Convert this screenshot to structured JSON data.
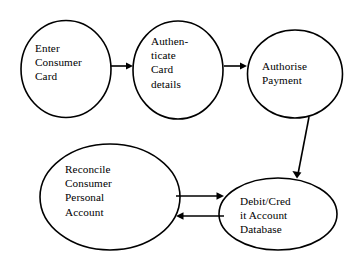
{
  "diagram": {
    "background_color": "#ffffff",
    "stroke_color": "#000000",
    "nodes": [
      {
        "id": "enter-consumer-card",
        "label": "Enter\nConsumer\nCard",
        "shape": "ellipse",
        "cx": 66,
        "cy": 69,
        "rx": 45,
        "ry": 48.5,
        "text_x": 35,
        "text_y": 41
      },
      {
        "id": "authenticate-card-details",
        "label": "Authen-\nticate\nCard\ndetails",
        "shape": "ellipse",
        "cx": 178,
        "cy": 70,
        "rx": 45,
        "ry": 49,
        "text_x": 151,
        "text_y": 34
      },
      {
        "id": "authorise-payment",
        "label": "Authorise\nPayment",
        "shape": "ellipse",
        "cx": 295,
        "cy": 74,
        "rx": 47.5,
        "ry": 44,
        "text_x": 262,
        "text_y": 59
      },
      {
        "id": "reconcile-consumer-personal-account",
        "label": "Reconcile\nConsumer\nPersonal\nAccount",
        "shape": "ellipse",
        "cx": 110,
        "cy": 197,
        "rx": 70,
        "ry": 53,
        "text_x": 65,
        "text_y": 162
      },
      {
        "id": "debit-credit-account-database",
        "label": "Debit/Cred\nit Account\nDatabase",
        "shape": "ellipse",
        "cx": 278,
        "cy": 214,
        "rx": 59,
        "ry": 36,
        "text_x": 240,
        "text_y": 194
      }
    ],
    "edges": [
      {
        "id": "edge-enter-to-authenticate",
        "from": "enter-consumer-card",
        "to": "authenticate-card-details",
        "direction": "right",
        "x1": 111,
        "y1": 66,
        "x2": 133,
        "y2": 66
      },
      {
        "id": "edge-authenticate-to-authorise",
        "from": "authenticate-card-details",
        "to": "authorise-payment",
        "direction": "right",
        "x1": 224,
        "y1": 66,
        "x2": 247,
        "y2": 66
      },
      {
        "id": "edge-authorise-to-database",
        "from": "authorise-payment",
        "to": "debit-credit-account-database",
        "direction": "diagonal-down-left",
        "x1": 309,
        "y1": 117,
        "x2": 297,
        "y2": 178
      },
      {
        "id": "edge-reconcile-to-database",
        "from": "reconcile-consumer-personal-account",
        "to": "debit-credit-account-database",
        "direction": "right",
        "x1": 176,
        "y1": 196,
        "x2": 224,
        "y2": 196
      },
      {
        "id": "edge-database-to-reconcile",
        "from": "debit-credit-account-database",
        "to": "reconcile-consumer-personal-account",
        "direction": "left",
        "x1": 224,
        "y1": 216,
        "x2": 176,
        "y2": 216
      }
    ]
  }
}
